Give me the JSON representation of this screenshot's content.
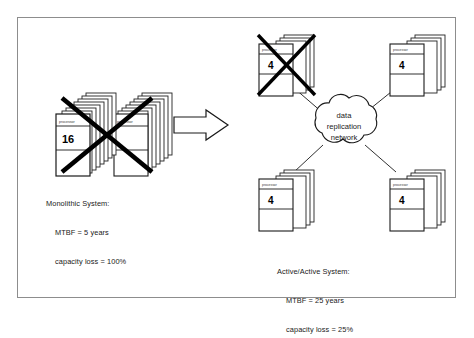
{
  "figure": {
    "background": "#ffffff",
    "border_color": "#8d8d8d",
    "ink_color": "#000000"
  },
  "left_system": {
    "node_label": "processor",
    "node_count": "16",
    "crossed_out": "true",
    "caption": {
      "line1": "Monolithic System:",
      "line2": "MTBF = 5 years",
      "line3": "capacity loss = 100%"
    }
  },
  "transition": {
    "arrow": "right-arrow",
    "direction": "right"
  },
  "right_system": {
    "cloud": {
      "line1": "data",
      "line2": "replication",
      "line3": "network"
    },
    "nodes": [
      {
        "position": "top-left",
        "label": "processor",
        "count": "4",
        "crossed_out": "true"
      },
      {
        "position": "top-right",
        "label": "processor",
        "count": "4",
        "crossed_out": "false"
      },
      {
        "position": "bottom-left",
        "label": "processor",
        "count": "4",
        "crossed_out": "false"
      },
      {
        "position": "bottom-right",
        "label": "processor",
        "count": "4",
        "crossed_out": "false"
      }
    ],
    "caption": {
      "line1": "Active/Active System:",
      "line2": "MTBF = 25 years",
      "line3": "capacity loss = 25%"
    }
  }
}
